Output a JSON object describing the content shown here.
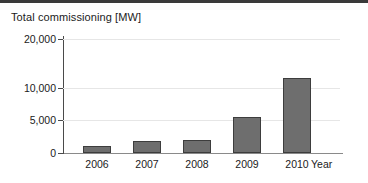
{
  "chart_data": {
    "type": "bar",
    "title": "Total commissioning [MW]",
    "xlabel": "Year",
    "ylabel": "",
    "categories": [
      "2006",
      "2007",
      "2008",
      "2009",
      "2010"
    ],
    "values": [
      1000,
      1800,
      2000,
      5400,
      12000
    ],
    "ytick_labels": [
      "0",
      "5,000",
      "10,000",
      "20,000"
    ],
    "ytick_values": [
      0,
      5000,
      10000,
      20000
    ],
    "ylim": [
      0,
      20000
    ],
    "grid": true,
    "legend": null,
    "bar_color": "#6e6e6e",
    "bar_border_color": "#3d3d3d",
    "gridline_color": "#e6e6e6",
    "axis_color": "#4a4a4a",
    "note": "Vertical axis spacing is non-linear: equal pixel bands between 0-5,000, 5,000-10,000 and 10,000-20,000."
  }
}
